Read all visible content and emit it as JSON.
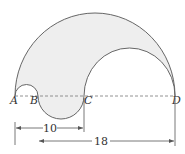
{
  "diagram": {
    "type": "geometry-semicircles",
    "points": [
      {
        "name": "A",
        "x": 15
      },
      {
        "name": "B",
        "x": 38
      },
      {
        "name": "C",
        "x": 84
      },
      {
        "name": "D",
        "x": 175
      }
    ],
    "labels": {
      "a": "A",
      "b": "B",
      "c": "C",
      "d": "D"
    },
    "dimensions": [
      {
        "from": "A",
        "to": "C",
        "value": "10"
      },
      {
        "from": "B",
        "to": "D",
        "value": "18"
      }
    ],
    "dim_ac": "10",
    "dim_bd": "18",
    "colors": {
      "shade": "#eeeeee",
      "stroke": "#666666",
      "dashed": "#777777"
    }
  }
}
